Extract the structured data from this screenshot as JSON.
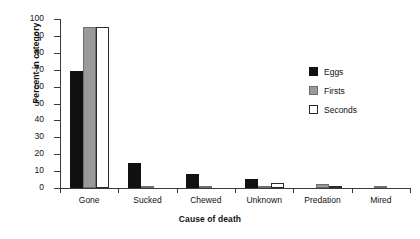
{
  "chart_data": {
    "type": "bar",
    "title": "",
    "xlabel": "Cause of death",
    "ylabel": "Percent in category",
    "ylim": [
      0,
      100
    ],
    "ytick_step": 10,
    "yticks": [
      0,
      10,
      20,
      30,
      40,
      50,
      60,
      70,
      80,
      90,
      100
    ],
    "ytick_labels": [
      "0",
      "10",
      "20",
      "30",
      "40",
      "50",
      "60",
      "70",
      "80",
      "90",
      "100"
    ],
    "grid": false,
    "legend_position": "upper right",
    "categories": [
      "Gone",
      "Sucked",
      "Chewed",
      "Unknown",
      "Predation",
      "Mired"
    ],
    "series": [
      {
        "name": "Eggs",
        "color": "#111111",
        "values": [
          69,
          15,
          8,
          5.5,
          0,
          0
        ]
      },
      {
        "name": "Firsts",
        "color": "#9a9a9a",
        "values": [
          95,
          0.6,
          0.6,
          0.6,
          2.2,
          0.6
        ]
      },
      {
        "name": "Seconds",
        "color": "#ffffff",
        "values": [
          95.5,
          0,
          0,
          3,
          1,
          0
        ]
      }
    ]
  },
  "legend": {
    "entries": [
      {
        "label": "Eggs",
        "swatch": "black-filled-square"
      },
      {
        "label": "Firsts",
        "swatch": "gray-filled-square"
      },
      {
        "label": "Seconds",
        "swatch": "white-outlined-square"
      }
    ]
  }
}
